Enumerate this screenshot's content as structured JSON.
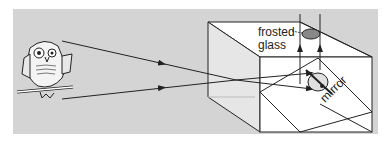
{
  "diagram": {
    "type": "periscope / camera obscura with mirror and frosted glass",
    "labels": {
      "frosted": "frosted",
      "glass": "glass",
      "mirror": "mirror"
    },
    "objects": [
      "owl-on-branch",
      "box",
      "pinhole",
      "mirror",
      "frosted-glass-image",
      "inverted-owl-image"
    ],
    "colors": {
      "background_panel": "#d4d4d4",
      "box_face": "#ffffff",
      "box_side_tint": "#e2e2e2",
      "lines": "#222222"
    }
  }
}
